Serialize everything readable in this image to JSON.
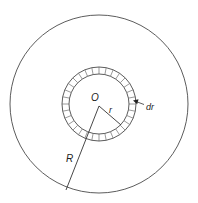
{
  "figure": {
    "type": "annular-ring-in-disk",
    "colors": {
      "stroke": "#4a4a4a",
      "text": "#222222",
      "background": "#ffffff"
    },
    "outer_circle": {
      "cx": 99,
      "cy": 104,
      "r": 89
    },
    "ring": {
      "cx": 99,
      "cy": 104,
      "r_inner": 30,
      "r_outer": 37,
      "segments": 32
    },
    "labels": {
      "center": "O",
      "small_radius": "r",
      "large_radius": "R",
      "thickness": "dr"
    }
  }
}
